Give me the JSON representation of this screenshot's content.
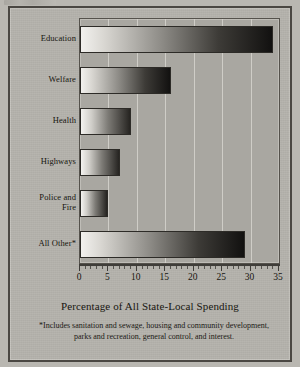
{
  "figure": {
    "top_fragment_icon": "clipped-text-fragment",
    "background_color": "#b5b3ad",
    "border_color": "#4a4742",
    "bar_gradient_from": "#f2f1ee",
    "bar_gradient_to": "#121110",
    "plot_background": "#a9a7a1",
    "gridline_color": "#d6d4ce"
  },
  "footnote": "*Includes sanitation and sewage, housing and community development, parks and recreation, general control, and interest.",
  "chart_data": {
    "type": "bar",
    "orientation": "horizontal",
    "title": "",
    "subtitle": "",
    "xlabel": "Percentage of All State-Local Spending",
    "ylabel": "",
    "categories": [
      "Education",
      "Welfare",
      "Health",
      "Highways",
      "Police and Fire",
      "All Other*"
    ],
    "category_lines": [
      [
        "Education"
      ],
      [
        "Welfare"
      ],
      [
        "Health"
      ],
      [
        "Highways"
      ],
      [
        "Police and",
        "Fire"
      ],
      [
        "All Other*"
      ]
    ],
    "values": [
      34,
      16,
      9,
      7,
      5,
      29
    ],
    "xlim": [
      0,
      35
    ],
    "xticks": [
      0,
      5,
      10,
      15,
      20,
      25,
      30,
      35
    ],
    "xtick_labels": [
      "0",
      "5",
      "10",
      "15",
      "20",
      "25",
      "30",
      "35"
    ],
    "minor_tick_step": 1,
    "gridlines": [
      5,
      10,
      15,
      20,
      25,
      30
    ],
    "grid": true,
    "legend": false,
    "legend_position": "none",
    "annotations": [
      "*Includes sanitation and sewage, housing and community development, parks and recreation, general control, and interest."
    ]
  }
}
